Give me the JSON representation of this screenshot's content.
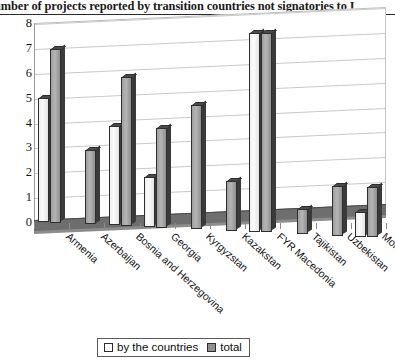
{
  "chart_data": {
    "type": "bar",
    "title": "umber of projects reported by transition countries not signatories to I",
    "title_truncated": true,
    "xlabel": "",
    "ylabel": "",
    "ylim": [
      0,
      8
    ],
    "yticks": [
      "0",
      "1",
      "2",
      "3",
      "4",
      "5",
      "6",
      "7",
      "8"
    ],
    "grid": true,
    "legend_position": "bottom",
    "style": "3d-column",
    "categories": [
      "Armenia",
      "Azerbaijan",
      "Bosnia and Herzegovina",
      "Georgia",
      "Kyrgyzstan",
      "Kazakstan",
      "FYR Macedonia",
      "Tajikistan",
      "Uzbekistan",
      "Moldova"
    ],
    "series": [
      {
        "name": "by the countries",
        "color": "#f4f4f4",
        "values": [
          5,
          null,
          4,
          2,
          null,
          null,
          8,
          null,
          null,
          1
        ]
      },
      {
        "name": "total",
        "color": "#9e9e9e",
        "values": [
          7,
          3,
          6,
          4,
          5,
          2,
          8,
          1,
          2,
          2
        ]
      }
    ]
  },
  "legend": {
    "items": [
      {
        "label": "by the countries",
        "swatch": "white"
      },
      {
        "label": "total",
        "swatch": "gray"
      }
    ]
  }
}
